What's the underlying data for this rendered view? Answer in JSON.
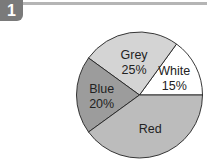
{
  "figure": {
    "number_badge": "1"
  },
  "chart_data": {
    "type": "pie",
    "title": "",
    "slices": [
      {
        "label": "White",
        "value": 15,
        "value_label": "15%",
        "color": "#ffffff"
      },
      {
        "label": "Grey",
        "value": 25,
        "value_label": "25%",
        "color": "#d4d4d4"
      },
      {
        "label": "Blue",
        "value": 20,
        "value_label": "20%",
        "color": "#9c9c9c"
      },
      {
        "label": "Red",
        "value": 40,
        "value_label": "",
        "color": "#bcbcbc"
      }
    ],
    "start_angle_deg": 0,
    "direction": "counterclockwise",
    "legend": "none"
  }
}
